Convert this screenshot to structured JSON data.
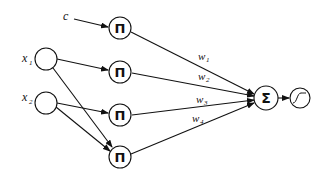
{
  "diagram": {
    "type": "product-unit neural network",
    "inputs": [
      {
        "id": "x1",
        "label": "x",
        "sub": "1"
      },
      {
        "id": "x2",
        "label": "x",
        "sub": "2"
      }
    ],
    "constant": {
      "label": "c"
    },
    "product_nodes": [
      {
        "id": "p1",
        "symbol": "Π"
      },
      {
        "id": "p2",
        "symbol": "Π"
      },
      {
        "id": "p3",
        "symbol": "Π"
      },
      {
        "id": "p4",
        "symbol": "Π"
      }
    ],
    "weights": [
      {
        "label": "w",
        "sub": "1"
      },
      {
        "label": "w",
        "sub": "2"
      },
      {
        "label": "w",
        "sub": "3"
      },
      {
        "label": "w",
        "sub": "4"
      }
    ],
    "sum_node": {
      "symbol": "Σ"
    },
    "activation": {
      "name": "sigmoid"
    },
    "colors": {
      "stroke": "#111111",
      "background": "#ffffff"
    }
  }
}
